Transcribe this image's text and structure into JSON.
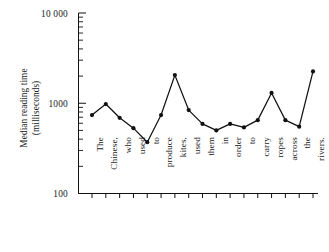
{
  "chart_data": {
    "type": "line",
    "title": "",
    "xlabel": "",
    "ylabel": "Median reading time (milliseconds)",
    "ylabel_lines": [
      "Median reading time",
      "(milliseconds)"
    ],
    "yscale": "log",
    "ylim": [
      100,
      10000
    ],
    "ytick_labels": [
      "10 000",
      "1000",
      "100"
    ],
    "ytick_values": [
      10000,
      1000,
      100
    ],
    "grid": false,
    "legend": false,
    "marker": "filled-circle",
    "line_color": "#111111",
    "categories": [
      "The",
      "Chinese,",
      "who",
      "used",
      "to",
      "produce",
      "kites,",
      "used",
      "them",
      "in",
      "order",
      "to",
      "carry",
      "ropes",
      "across",
      "the",
      "rivers."
    ],
    "values": [
      740,
      980,
      690,
      530,
      370,
      740,
      2050,
      840,
      590,
      500,
      590,
      540,
      650,
      1300,
      650,
      550,
      2250
    ],
    "sentence": "The Chinese, who used to produce kites, used them in order to carry ropes across the rivers."
  }
}
